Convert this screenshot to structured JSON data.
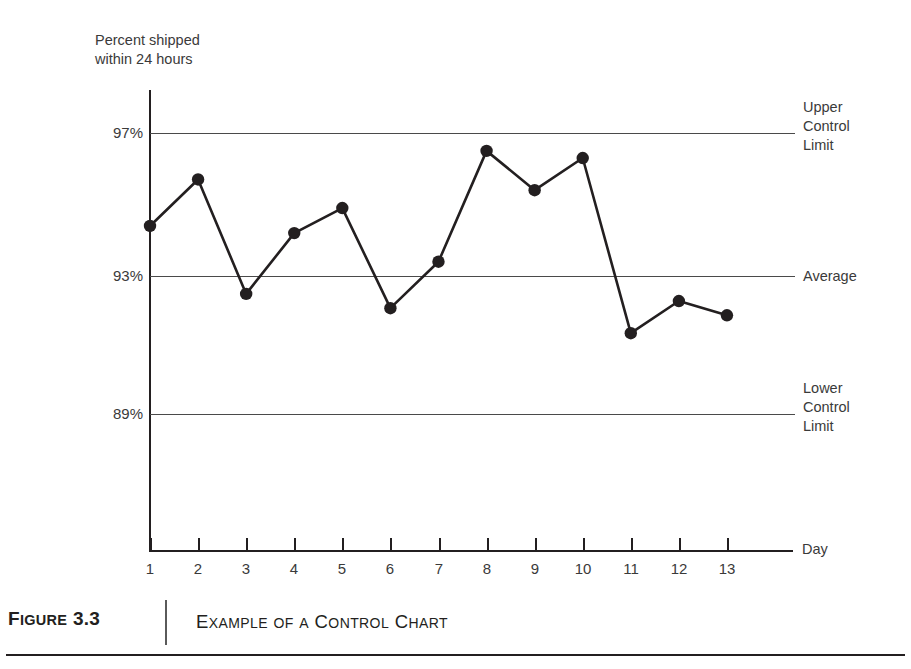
{
  "chart_data": {
    "type": "line",
    "title": "Example of a Control Chart",
    "xlabel": "Day",
    "ylabel": "Percent shipped within 24 hours",
    "categories": [
      "1",
      "2",
      "3",
      "4",
      "5",
      "6",
      "7",
      "8",
      "9",
      "10",
      "11",
      "12",
      "13"
    ],
    "x": [
      1,
      2,
      3,
      4,
      5,
      6,
      7,
      8,
      9,
      10,
      11,
      12,
      13
    ],
    "values": [
      94.4,
      95.7,
      92.5,
      94.2,
      94.9,
      92.1,
      93.4,
      96.5,
      95.4,
      96.3,
      91.4,
      92.3,
      91.9
    ],
    "series": [
      {
        "name": "Percent shipped within 24 hours",
        "values": [
          94.4,
          95.7,
          92.5,
          94.2,
          94.9,
          92.1,
          93.4,
          96.5,
          95.4,
          96.3,
          91.4,
          92.3,
          91.9
        ]
      }
    ],
    "ylim": [
      85.0,
      98.2
    ],
    "xlim": [
      1,
      13
    ],
    "ytick_labels": [
      "97%",
      "93%",
      "89%"
    ],
    "ytick_values": [
      97,
      93,
      89
    ],
    "xtick_labels": [
      "1",
      "2",
      "3",
      "4",
      "5",
      "6",
      "7",
      "8",
      "9",
      "10",
      "11",
      "12",
      "13"
    ],
    "grid": false,
    "legend_position": "right-outside",
    "reference_lines": [
      {
        "label": "Upper Control Limit",
        "value": 97
      },
      {
        "label": "Average",
        "value": 93
      },
      {
        "label": "Lower Control Limit",
        "value": 89
      }
    ],
    "marker": "filled-circle",
    "line_color": "#231f20",
    "marker_color": "#231f20"
  },
  "axis": {
    "y_title_line1": "Percent shipped",
    "y_title_line2": "within 24 hours",
    "x_title": "Day"
  },
  "y_ticks": [
    {
      "label": "97%"
    },
    {
      "label": "93%"
    },
    {
      "label": "89%"
    }
  ],
  "x_ticks": [
    {
      "label": "1"
    },
    {
      "label": "2"
    },
    {
      "label": "3"
    },
    {
      "label": "4"
    },
    {
      "label": "5"
    },
    {
      "label": "6"
    },
    {
      "label": "7"
    },
    {
      "label": "8"
    },
    {
      "label": "9"
    },
    {
      "label": "10"
    },
    {
      "label": "11"
    },
    {
      "label": "12"
    },
    {
      "label": "13"
    }
  ],
  "annotations": {
    "ucl_line1": "Upper",
    "ucl_line2": "Control",
    "ucl_line3": "Limit",
    "average": "Average",
    "lcl_line1": "Lower",
    "lcl_line2": "Control",
    "lcl_line3": "Limit"
  },
  "caption": {
    "figure_label_lead": "F",
    "figure_label_rest": "IGURE",
    "figure_number": "3.3",
    "title_parts": [
      {
        "lead": "E",
        "rest": "XAMPLE"
      },
      {
        "lead": "",
        "rest": "OF"
      },
      {
        "lead": "",
        "rest": "A"
      },
      {
        "lead": "C",
        "rest": "ONTROL"
      },
      {
        "lead": "C",
        "rest": "HART"
      }
    ],
    "title_plain": "Example of a Control Chart"
  },
  "colors": {
    "ink": "#231f20",
    "gridline": "#4a4a4a",
    "text": "#3a3a3a",
    "background": "#ffffff"
  }
}
